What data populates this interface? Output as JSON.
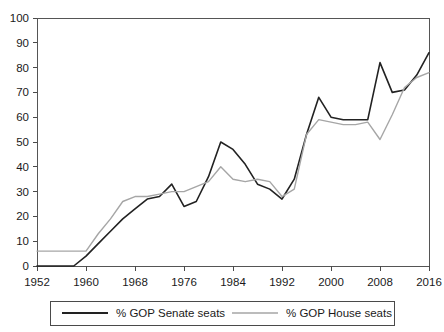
{
  "chart_data": {
    "type": "line",
    "title": "",
    "xlabel": "",
    "ylabel": "",
    "xlim": [
      1952,
      2016
    ],
    "ylim": [
      0,
      100
    ],
    "grid": false,
    "legend_position": "bottom",
    "xticks": [
      1952,
      1960,
      1968,
      1976,
      1984,
      1992,
      2000,
      2008,
      2016
    ],
    "yticks": [
      0,
      10,
      20,
      30,
      40,
      50,
      60,
      70,
      80,
      90,
      100
    ],
    "x": [
      1952,
      1954,
      1956,
      1958,
      1960,
      1962,
      1964,
      1966,
      1968,
      1970,
      1972,
      1974,
      1976,
      1978,
      1980,
      1982,
      1984,
      1986,
      1988,
      1990,
      1992,
      1994,
      1996,
      1998,
      2000,
      2002,
      2004,
      2006,
      2008,
      2010,
      2012,
      2014,
      2016
    ],
    "series": [
      {
        "name": "% GOP Senate seats",
        "color": "#222222",
        "values": [
          0,
          0,
          0,
          0,
          4,
          9,
          14,
          19,
          23,
          27,
          28,
          33,
          24,
          26,
          36,
          50,
          47,
          41,
          33,
          31,
          27,
          35,
          53,
          68,
          60,
          59,
          59,
          59,
          82,
          70,
          71,
          77,
          86
        ]
      },
      {
        "name": "% GOP House seats",
        "color": "#a6a6a6",
        "values": [
          6,
          6,
          6,
          6,
          6,
          13,
          19,
          26,
          28,
          28,
          29,
          30,
          30,
          32,
          34,
          40,
          35,
          34,
          35,
          34,
          28,
          31,
          53,
          59,
          58,
          57,
          57,
          58,
          51,
          61,
          72,
          76,
          78
        ]
      }
    ],
    "legend": [
      {
        "label": "% GOP Senate seats",
        "color": "#222222"
      },
      {
        "label": "% GOP House seats",
        "color": "#a6a6a6"
      }
    ]
  }
}
